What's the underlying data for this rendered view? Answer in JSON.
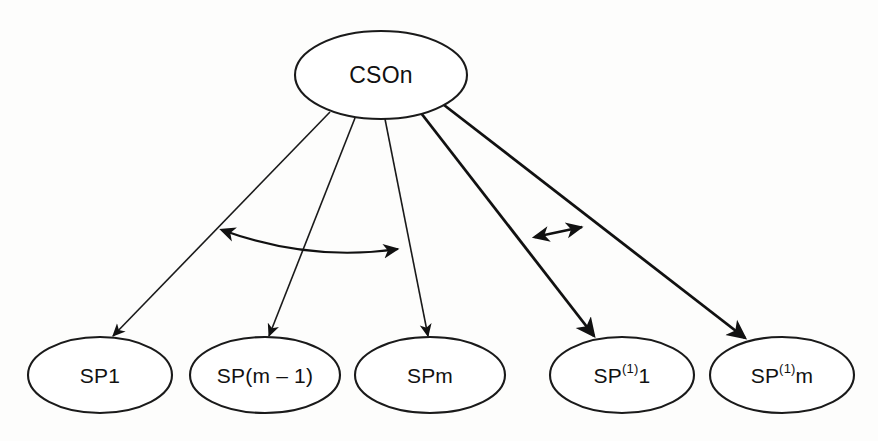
{
  "diagram": {
    "type": "node-link",
    "canvas": {
      "width": 878,
      "height": 441
    },
    "colors": {
      "background": "#fdfdfc",
      "stroke": "#1a1a1a",
      "node_fill": "#ffffff",
      "text": "#111111"
    },
    "root": {
      "id": "cson",
      "label": "CSOn",
      "cx": 381,
      "cy": 75,
      "rx": 86,
      "ry": 44
    },
    "leaves": [
      {
        "id": "sp1",
        "label": "SP1",
        "base": "SP",
        "sup": "",
        "suffix": "1",
        "cx": 100,
        "cy": 375,
        "rx": 72,
        "ry": 38
      },
      {
        "id": "spm1",
        "label": "SP(m – 1)",
        "base": "SP(m – 1)",
        "sup": "",
        "suffix": "",
        "cx": 265,
        "cy": 375,
        "rx": 75,
        "ry": 38
      },
      {
        "id": "spm",
        "label": "SPm",
        "base": "SP",
        "sup": "",
        "suffix": "m",
        "cx": 430,
        "cy": 375,
        "rx": 75,
        "ry": 38
      },
      {
        "id": "sp11",
        "label": "SP(1)1",
        "base": "SP",
        "sup": "(1)",
        "suffix": "1",
        "cx": 622,
        "cy": 375,
        "rx": 72,
        "ry": 38
      },
      {
        "id": "sp1m",
        "label": "SP(1)m",
        "base": "SP",
        "sup": "(1)",
        "suffix": "m",
        "cx": 782,
        "cy": 375,
        "rx": 72,
        "ry": 38
      }
    ],
    "edges": [
      {
        "id": "edge-cson-sp1",
        "from": "cson",
        "to": "sp1",
        "weight": "thin",
        "arrow": "end",
        "path": "M 330,112 L 113,336"
      },
      {
        "id": "edge-cson-spm1",
        "from": "cson",
        "to": "spm1",
        "weight": "thin",
        "arrow": "end",
        "path": "M 355,118 L 269,336"
      },
      {
        "id": "edge-cson-spm",
        "from": "cson",
        "to": "spm",
        "weight": "thin",
        "arrow": "end",
        "path": "M 385,119 L 428,336"
      },
      {
        "id": "edge-cson-sp11",
        "from": "cson",
        "to": "sp11",
        "weight": "thick",
        "arrow": "end",
        "path": "M 421,113 L 594,336"
      },
      {
        "id": "edge-cson-sp1m",
        "from": "cson",
        "to": "sp1m",
        "weight": "thick",
        "arrow": "end",
        "path": "M 444,105 L 745,338"
      }
    ],
    "relations": [
      {
        "id": "relation-curve-left",
        "style": "curved",
        "arrow": "both",
        "path": "M 222,230 Q 310,262 398,249",
        "connects": [
          "edge-cson-sp1",
          "edge-cson-spm"
        ]
      },
      {
        "id": "relation-arrow-right",
        "style": "straight",
        "arrow": "both",
        "path": "M 535,237 L 582,227",
        "connects": [
          "edge-cson-sp11",
          "edge-cson-sp1m"
        ]
      }
    ]
  }
}
